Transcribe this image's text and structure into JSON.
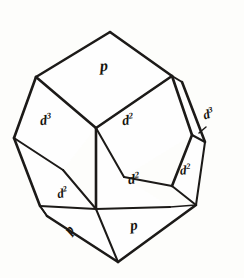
{
  "figure": {
    "type": "crystal-form-line-drawing",
    "background_color": "#fdfdfb",
    "ink_color": "#1c1a18"
  },
  "labels": {
    "top_face": {
      "symbol": "p",
      "superscript": ""
    },
    "upper_left_face": {
      "symbol": "d",
      "superscript": "3"
    },
    "upper_right_face": {
      "symbol": "d",
      "superscript": "2"
    },
    "right_sliver_face": {
      "symbol": "d",
      "superscript": "3"
    },
    "lower_center_face": {
      "symbol": "d",
      "superscript": "2"
    },
    "lower_left_face": {
      "symbol": "d",
      "superscript": "2"
    },
    "right_lower_face": {
      "symbol": "d",
      "superscript": "2"
    },
    "bottom_right_face": {
      "symbol": "p",
      "superscript": ""
    },
    "bottom_left_face": {
      "symbol": "p",
      "superscript": ""
    }
  },
  "geometry": {
    "top_apex": [
      110,
      32
    ],
    "bottom_apex": [
      118,
      262
    ],
    "left_vertex": [
      14,
      138
    ],
    "right_vertex": [
      218,
      150
    ]
  }
}
